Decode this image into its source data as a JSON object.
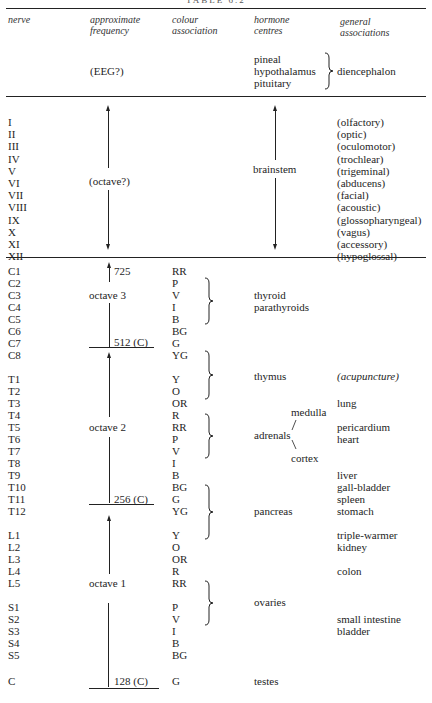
{
  "title": "TABLE 6.2",
  "headers": {
    "nerve": "nerve",
    "frequency": [
      "approximate",
      "frequency"
    ],
    "colour": [
      "colour",
      "association"
    ],
    "hormone": [
      "hormone",
      "centres"
    ],
    "general": [
      "general",
      "associations"
    ]
  },
  "top_section": {
    "frequency": "(EEG?)",
    "hormone_centres": [
      "pineal",
      "hypothalamus",
      "pituitary"
    ],
    "general": "diencephalon"
  },
  "cranial": {
    "frequency": "(octave?)",
    "hormone": "brainstem",
    "rows": [
      {
        "nerve": "I",
        "general": "(olfactory)"
      },
      {
        "nerve": "II",
        "general": "(optic)"
      },
      {
        "nerve": "III",
        "general": "(oculomotor)"
      },
      {
        "nerve": "IV",
        "general": "(trochlear)"
      },
      {
        "nerve": "V",
        "general": "(trigeminal)"
      },
      {
        "nerve": "VI",
        "general": "(abducens)"
      },
      {
        "nerve": "VII",
        "general": "(facial)"
      },
      {
        "nerve": "VIII",
        "general": "(acoustic)"
      },
      {
        "nerve": "IX",
        "general": "(glossopharyngeal)"
      },
      {
        "nerve": "X",
        "general": "(vagus)"
      },
      {
        "nerve": "XI",
        "general": "(accessory)"
      },
      {
        "nerve": "XII",
        "general": "(hypoglossal)"
      }
    ]
  },
  "frequency_labels": {
    "top": "725",
    "octave3": "octave 3",
    "c512": "512 (C)",
    "octave2": "octave 2",
    "c256": "256 (C)",
    "octave1": "octave 1",
    "c128": "128 (C)"
  },
  "spinal": [
    {
      "nerve": "C1",
      "colour": "RR",
      "y": 265
    },
    {
      "nerve": "C2",
      "colour": "P",
      "y": 277
    },
    {
      "nerve": "C3",
      "colour": "V",
      "y": 289
    },
    {
      "nerve": "C4",
      "colour": "I",
      "y": 301
    },
    {
      "nerve": "C5",
      "colour": "B",
      "y": 313
    },
    {
      "nerve": "C6",
      "colour": "BG",
      "y": 325
    },
    {
      "nerve": "C7",
      "colour": "G",
      "y": 337
    },
    {
      "nerve": "C8",
      "colour": "YG",
      "y": 349
    },
    {
      "nerve": "T1",
      "colour": "Y",
      "y": 373
    },
    {
      "nerve": "T2",
      "colour": "O",
      "y": 385
    },
    {
      "nerve": "T3",
      "colour": "OR",
      "y": 397
    },
    {
      "nerve": "T4",
      "colour": "R",
      "y": 409
    },
    {
      "nerve": "T5",
      "colour": "RR",
      "y": 421
    },
    {
      "nerve": "T6",
      "colour": "P",
      "y": 433
    },
    {
      "nerve": "T7",
      "colour": "V",
      "y": 445
    },
    {
      "nerve": "T8",
      "colour": "I",
      "y": 457
    },
    {
      "nerve": "T9",
      "colour": "B",
      "y": 469
    },
    {
      "nerve": "T10",
      "colour": "BG",
      "y": 481
    },
    {
      "nerve": "T11",
      "colour": "G",
      "y": 493
    },
    {
      "nerve": "T12",
      "colour": "YG",
      "y": 505
    },
    {
      "nerve": "L1",
      "colour": "Y",
      "y": 529
    },
    {
      "nerve": "L2",
      "colour": "O",
      "y": 541
    },
    {
      "nerve": "L3",
      "colour": "OR",
      "y": 553
    },
    {
      "nerve": "L4",
      "colour": "R",
      "y": 565
    },
    {
      "nerve": "L5",
      "colour": "RR",
      "y": 577
    },
    {
      "nerve": "S1",
      "colour": "P",
      "y": 601
    },
    {
      "nerve": "S2",
      "colour": "V",
      "y": 613
    },
    {
      "nerve": "S3",
      "colour": "I",
      "y": 625
    },
    {
      "nerve": "S4",
      "colour": "B",
      "y": 637
    },
    {
      "nerve": "S5",
      "colour": "BG",
      "y": 649
    },
    {
      "nerve": "C",
      "colour": "G",
      "y": 675
    }
  ],
  "hormones": {
    "thyroid": "thyroid",
    "parathyroids": "parathyroids",
    "thymus": "thymus",
    "medulla": "medulla",
    "adrenals": "adrenals",
    "cortex": "cortex",
    "pancreas": "pancreas",
    "ovaries": "ovaries",
    "testes": "testes"
  },
  "general_assoc": [
    {
      "text": "(acupuncture)",
      "y": 373,
      "italic": true
    },
    {
      "text": "lung",
      "y": 397
    },
    {
      "text": "pericardium",
      "y": 421
    },
    {
      "text": "heart",
      "y": 433
    },
    {
      "text": "liver",
      "y": 469
    },
    {
      "text": "gall-bladder",
      "y": 481
    },
    {
      "text": "spleen",
      "y": 493
    },
    {
      "text": "stomach",
      "y": 505
    },
    {
      "text": "triple-warmer",
      "y": 529
    },
    {
      "text": "kidney",
      "y": 541
    },
    {
      "text": "colon",
      "y": 565
    },
    {
      "text": "small intestine",
      "y": 613
    },
    {
      "text": "bladder",
      "y": 625
    }
  ]
}
